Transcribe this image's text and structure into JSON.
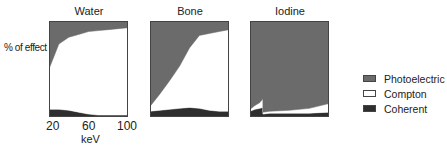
{
  "chart_data": [
    {
      "type": "area",
      "title": "Water",
      "xlabel": "keV",
      "ylabel": "% of effect",
      "x_ticks": [
        20,
        60,
        100
      ],
      "xlim": [
        20,
        100
      ],
      "ylim": [
        0,
        100
      ],
      "stacked": true,
      "x": [
        20,
        30,
        40,
        50,
        60,
        70,
        80,
        90,
        100
      ],
      "series": [
        {
          "name": "Coherent",
          "values": [
            8,
            8,
            7,
            5,
            3,
            2,
            2,
            2,
            2
          ]
        },
        {
          "name": "Compton",
          "values": [
            42,
            68,
            76,
            81,
            86,
            88,
            89,
            90,
            91
          ]
        },
        {
          "name": "Photoelectric",
          "values": [
            50,
            24,
            17,
            14,
            11,
            10,
            9,
            8,
            7
          ]
        }
      ]
    },
    {
      "type": "area",
      "title": "Bone",
      "xlim": [
        20,
        100
      ],
      "ylim": [
        0,
        100
      ],
      "stacked": true,
      "x": [
        20,
        30,
        40,
        50,
        60,
        70,
        80,
        90,
        100
      ],
      "series": [
        {
          "name": "Coherent",
          "values": [
            6,
            7,
            8,
            9,
            10,
            9,
            7,
            6,
            6
          ]
        },
        {
          "name": "Compton",
          "values": [
            5,
            17,
            30,
            44,
            62,
            76,
            80,
            83,
            85
          ]
        },
        {
          "name": "Photoelectric",
          "values": [
            89,
            76,
            62,
            47,
            28,
            15,
            13,
            11,
            9
          ]
        }
      ]
    },
    {
      "type": "area",
      "title": "Iodine",
      "xlim": [
        20,
        100
      ],
      "ylim": [
        0,
        100
      ],
      "stacked": true,
      "annotations": [
        "K-edge discontinuity near 33 keV"
      ],
      "x": [
        20,
        25,
        30,
        33,
        33.1,
        40,
        60,
        80,
        100
      ],
      "series": [
        {
          "name": "Coherent",
          "values": [
            6,
            8,
            9,
            10,
            3,
            4,
            4,
            4,
            5
          ]
        },
        {
          "name": "Compton",
          "values": [
            2,
            4,
            6,
            9,
            2,
            2,
            3,
            5,
            9
          ]
        },
        {
          "name": "Photoelectric",
          "values": [
            92,
            88,
            85,
            81,
            95,
            94,
            93,
            91,
            86
          ]
        }
      ]
    }
  ],
  "panels": [
    {
      "title": "Water"
    },
    {
      "title": "Bone"
    },
    {
      "title": "Iodine"
    }
  ],
  "axis": {
    "ylabel": "% of effect",
    "xlabel": "keV",
    "ticks": [
      "20",
      "60",
      "100"
    ]
  },
  "legend": [
    {
      "label": "Photoelectric",
      "color": "#6b6b6b"
    },
    {
      "label": "Compton",
      "color": "#ffffff"
    },
    {
      "label": "Coherent",
      "color": "#2e2e2e"
    }
  ],
  "colors": {
    "photoelectric": "#6b6b6b",
    "compton": "#ffffff",
    "coherent": "#2e2e2e",
    "frame": "#444444"
  }
}
